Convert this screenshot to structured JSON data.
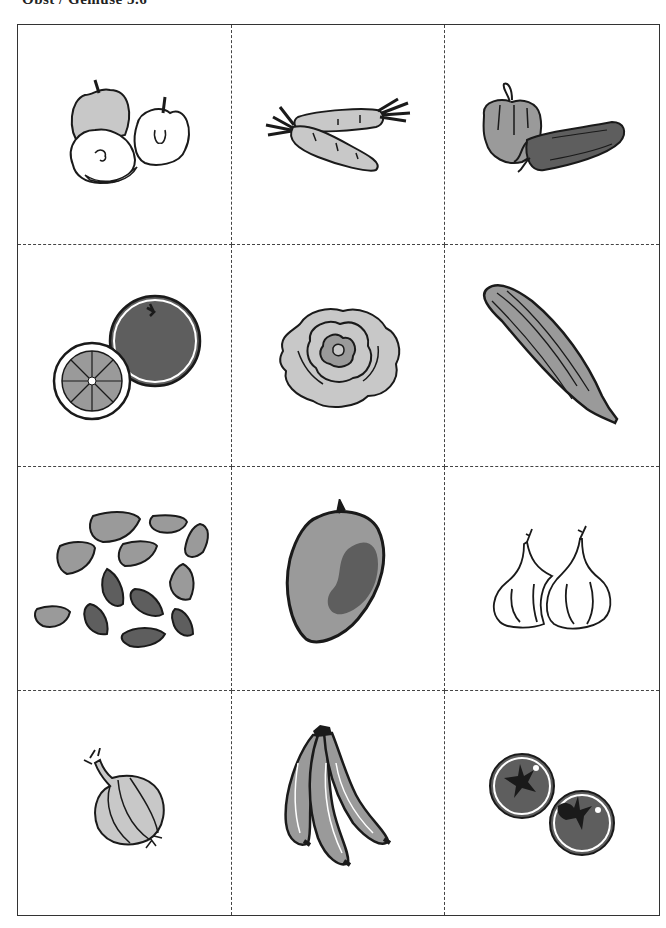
{
  "header": {
    "title_partial": "Obst / Gemüse 5.6"
  },
  "grid": {
    "columns": 3,
    "rows": 4,
    "cells": [
      {
        "label": "Apples",
        "icon": "apple-icon"
      },
      {
        "label": "Carrots",
        "icon": "carrot-icon"
      },
      {
        "label": "Bell peppers",
        "icon": "pepper-icon"
      },
      {
        "label": "Orange",
        "icon": "orange-icon"
      },
      {
        "label": "Lettuce",
        "icon": "lettuce-icon"
      },
      {
        "label": "Cucumber",
        "icon": "cucumber-icon"
      },
      {
        "label": "Almonds",
        "icon": "almond-icon"
      },
      {
        "label": "Mango",
        "icon": "mango-icon"
      },
      {
        "label": "Garlic",
        "icon": "garlic-icon"
      },
      {
        "label": "Onion",
        "icon": "onion-icon"
      },
      {
        "label": "Bananas",
        "icon": "banana-icon"
      },
      {
        "label": "Tomatoes",
        "icon": "tomato-icon"
      }
    ]
  },
  "colors": {
    "outline": "#1a1a1a",
    "light_gray": "#c8c8c8",
    "mid_gray": "#9a9a9a",
    "dark_gray": "#5e5e5e",
    "border": "#333333"
  }
}
